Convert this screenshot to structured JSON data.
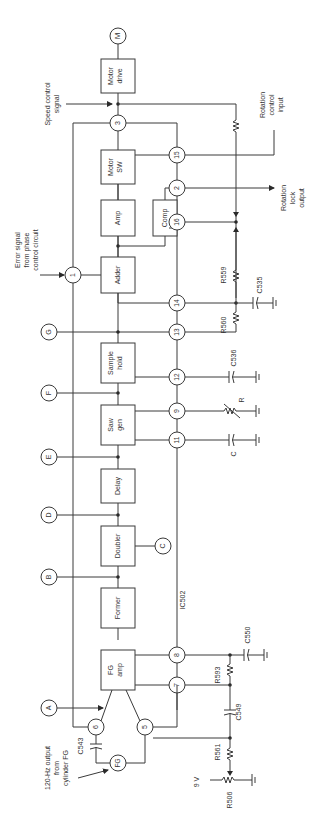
{
  "diagram": {
    "orientation": "rotated-90-ccw",
    "ic_label": "IC502",
    "blocks": [
      {
        "id": "motor_drive",
        "line1": "Motor",
        "line2": "drive"
      },
      {
        "id": "motor_sw",
        "line1": "Motor",
        "line2": "SW"
      },
      {
        "id": "amp",
        "line1": "Amp",
        "line2": ""
      },
      {
        "id": "comp",
        "line1": "Comp",
        "line2": ""
      },
      {
        "id": "adder",
        "line1": "Adder",
        "line2": ""
      },
      {
        "id": "sample_hold",
        "line1": "Sample",
        "line2": "hold"
      },
      {
        "id": "saw_gen",
        "line1": "Saw",
        "line2": "gen"
      },
      {
        "id": "delay",
        "line1": "Delay",
        "line2": ""
      },
      {
        "id": "doubler",
        "line1": "Doubler",
        "line2": ""
      },
      {
        "id": "former",
        "line1": "Former",
        "line2": ""
      },
      {
        "id": "fg_amp",
        "line1": "FG",
        "line2": "amp"
      }
    ],
    "pins": [
      "1",
      "2",
      "3",
      "5",
      "6",
      "7",
      "8",
      "9",
      "11",
      "12",
      "13",
      "14",
      "15",
      "16"
    ],
    "test_points": [
      "A",
      "B",
      "C",
      "D",
      "E",
      "F",
      "G"
    ],
    "motor_symbol": "M",
    "fg_symbol": "FG",
    "components": {
      "r559": "R559",
      "r560": "R560",
      "c535": "C535",
      "c536": "C536",
      "r": "R",
      "c": "C",
      "c550": "C550",
      "r593": "R593",
      "c549": "C549",
      "r561": "R561",
      "r506": "R506",
      "c543": "C543"
    },
    "supply": "9 V",
    "labels": {
      "speed_control_1": "Speed control",
      "speed_control_2": "signal",
      "error_1": "Error signal",
      "error_2": "from phase",
      "error_3": "control circuit",
      "rot_ctrl_1": "Rotation",
      "rot_ctrl_2": "control",
      "rot_ctrl_3": "input",
      "rot_lock_1": "Rotation",
      "rot_lock_2": "lock",
      "rot_lock_3": "output",
      "fg_out_1": "120-Hz output",
      "fg_out_2": "from",
      "fg_out_3": "cylinder FG"
    }
  }
}
